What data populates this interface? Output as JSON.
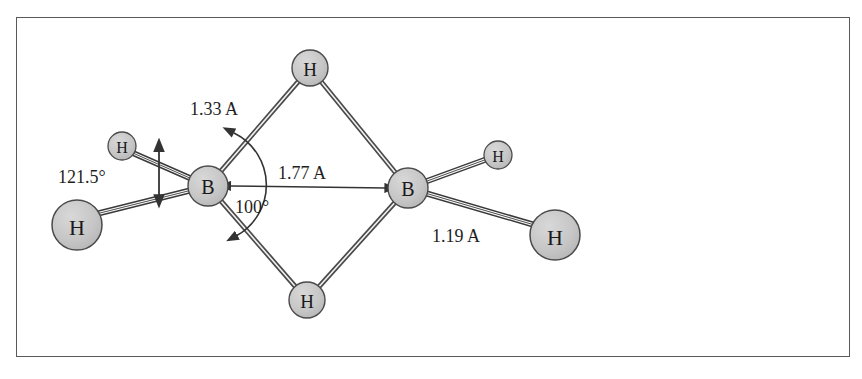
{
  "figure": {
    "frame": {
      "x": 16,
      "y": 17,
      "width": 834,
      "height": 340,
      "stroke": "#58595b"
    },
    "background": "#ffffff",
    "atom_fill": "#c8c8c8",
    "atom_stroke": "#4a4a4a",
    "bond_stroke": "#4a4a4a",
    "text_color": "#1f1f1f"
  },
  "atoms": [
    {
      "id": "h-top",
      "label": "H",
      "cx": 310,
      "cy": 68,
      "r": 18,
      "font_size": 19
    },
    {
      "id": "h-bottom",
      "label": "H",
      "cx": 307,
      "cy": 300,
      "r": 18,
      "font_size": 19
    },
    {
      "id": "b-left",
      "label": "B",
      "cx": 208,
      "cy": 186,
      "r": 20,
      "font_size": 20
    },
    {
      "id": "b-right",
      "label": "B",
      "cx": 408,
      "cy": 188,
      "r": 20,
      "font_size": 20
    },
    {
      "id": "h-upper-left",
      "label": "H",
      "cx": 122,
      "cy": 146,
      "r": 14,
      "font_size": 16
    },
    {
      "id": "h-lower-left",
      "label": "H",
      "cx": 77,
      "cy": 225,
      "r": 25,
      "font_size": 22
    },
    {
      "id": "h-upper-right",
      "label": "H",
      "cx": 498,
      "cy": 155,
      "r": 14,
      "font_size": 16
    },
    {
      "id": "h-lower-right",
      "label": "H",
      "cx": 555,
      "cy": 235,
      "r": 25,
      "font_size": 22
    }
  ],
  "bonds": [
    {
      "id": "bond-bleft-htop",
      "from": "b-left",
      "to": "h-top"
    },
    {
      "id": "bond-htop-bright",
      "from": "h-top",
      "to": "b-right"
    },
    {
      "id": "bond-bleft-hbottom",
      "from": "b-left",
      "to": "h-bottom"
    },
    {
      "id": "bond-hbottom-bright",
      "from": "h-bottom",
      "to": "b-right"
    },
    {
      "id": "bond-bleft-hupperleft",
      "from": "b-left",
      "to": "h-upper-left"
    },
    {
      "id": "bond-bleft-hlowerleft",
      "from": "b-left",
      "to": "h-lower-left"
    },
    {
      "id": "bond-bright-hupperright",
      "from": "b-right",
      "to": "h-upper-right"
    },
    {
      "id": "bond-bright-hlowerright",
      "from": "b-right",
      "to": "h-lower-right"
    }
  ],
  "annotations": {
    "bridge_bond_length": {
      "id": "label-1-33-a",
      "text": "1.33 A",
      "x": 190,
      "y": 111,
      "font_size": 18
    },
    "boron_boron_distance": {
      "id": "label-1-77-a",
      "text": "1.77 A",
      "x": 278,
      "y": 175,
      "font_size": 18
    },
    "terminal_bond_length": {
      "id": "label-1-19-a",
      "text": "1.19 A",
      "x": 432,
      "y": 238,
      "font_size": 18
    },
    "terminal_angle": {
      "id": "label-121-5-deg",
      "text": "121.5°",
      "x": 58,
      "y": 179,
      "font_size": 18
    },
    "bridge_angle": {
      "id": "label-100-deg",
      "text": "100°",
      "x": 235,
      "y": 209,
      "font_size": 18
    }
  },
  "measurement_arrows": [
    {
      "id": "arrow-b-b-distance",
      "kind": "double-headed-straight",
      "x1": 231,
      "y1": 186,
      "x2": 386,
      "y2": 188
    },
    {
      "id": "arrow-terminal-angle-span",
      "kind": "double-headed-vertical",
      "x1": 158,
      "y1": 155,
      "x2": 158,
      "y2": 194
    },
    {
      "id": "arc-bridge-angle",
      "kind": "arc-double-headed",
      "cx": 208,
      "cy": 186,
      "radius": 56,
      "start_deg": -62,
      "end_deg": 58
    }
  ]
}
